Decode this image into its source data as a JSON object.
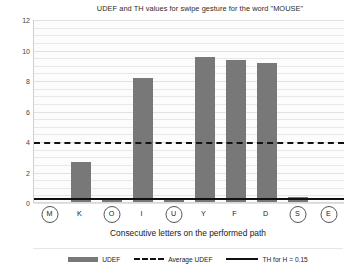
{
  "chart_data": {
    "type": "bar",
    "title": "UDEF and TH values for swipe gesture for the word  \"MOUSE\"",
    "xlabel": "Consecutive letters on the performed path",
    "ylabel": "",
    "categories": [
      "M",
      "K",
      "O",
      "I",
      "U",
      "Y",
      "F",
      "D",
      "S",
      "E"
    ],
    "values": [
      0.0,
      2.7,
      0.2,
      8.2,
      0.25,
      9.6,
      9.4,
      9.15,
      0.4,
      0.0
    ],
    "circled": [
      true,
      false,
      true,
      false,
      true,
      false,
      false,
      false,
      true,
      true
    ],
    "ylim": [
      0,
      12
    ],
    "yticks": [
      0,
      2,
      4,
      6,
      8,
      10,
      12
    ],
    "ytick_labels": [
      "0",
      "2",
      "4",
      "6",
      "8",
      "10",
      "12"
    ],
    "grid": true,
    "series": [
      {
        "name": "UDEF",
        "type": "bar",
        "values": [
          0.0,
          2.7,
          0.2,
          8.2,
          0.25,
          9.6,
          9.4,
          9.15,
          0.4,
          0.0
        ]
      },
      {
        "name": "Average UDEF",
        "type": "hline",
        "value": 4.0
      },
      {
        "name": "TH for H = 0.15",
        "type": "hline",
        "value": 0.35
      }
    ],
    "reference_lines": {
      "average_udef": 4.0,
      "th_for_h": 0.35
    },
    "legend_position": "bottom",
    "colors": {
      "bar": "#787878",
      "average_line": "#111111",
      "th_line": "#111111",
      "grid": "#e8e8e8",
      "background": "#ffffff"
    }
  },
  "legend": {
    "items": [
      {
        "label": "UDEF",
        "marker": "bar-swatch"
      },
      {
        "label": "Average UDEF",
        "marker": "dashed-line"
      },
      {
        "label": "TH for H = 0.15",
        "marker": "solid-line"
      }
    ]
  }
}
